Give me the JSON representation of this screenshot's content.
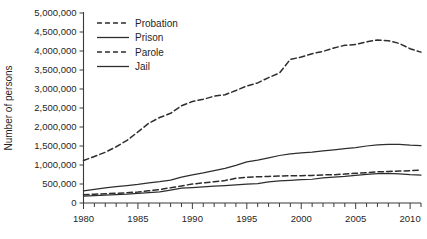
{
  "chart_data": {
    "type": "line",
    "title": "",
    "xlabel": "",
    "ylabel": "Number of persons",
    "xlim": [
      1980,
      2011
    ],
    "ylim": [
      0,
      5000000
    ],
    "grid": false,
    "legend_position": "top-left",
    "xticklabels": [
      "1980",
      "1985",
      "1990",
      "1995",
      "2000",
      "2005",
      "2010"
    ],
    "xtickvalues": [
      1980,
      1985,
      1990,
      1995,
      2000,
      2005,
      2010
    ],
    "xminortick_step": 1,
    "yticklabels": [
      "0",
      "500,000",
      "1,000,000",
      "1,500,000",
      "2,000,000",
      "2,500,000",
      "3,000,000",
      "3,500,000",
      "4,000,000",
      "4,500,000",
      "5,000,000"
    ],
    "ytickvalues": [
      0,
      500000,
      1000000,
      1500000,
      2000000,
      2500000,
      3000000,
      3500000,
      4000000,
      4500000,
      5000000
    ],
    "x": [
      1980,
      1981,
      1982,
      1983,
      1984,
      1985,
      1986,
      1987,
      1988,
      1989,
      1990,
      1991,
      1992,
      1993,
      1994,
      1995,
      1996,
      1997,
      1998,
      1999,
      2000,
      2001,
      2002,
      2003,
      2004,
      2005,
      2006,
      2007,
      2008,
      2009,
      2010,
      2011
    ],
    "series": [
      {
        "name": "Probation",
        "style": "dashed",
        "color": "#2e2e2e",
        "values": [
          1118000,
          1225000,
          1335000,
          1480000,
          1650000,
          1870000,
          2100000,
          2250000,
          2360000,
          2560000,
          2670000,
          2730000,
          2810000,
          2850000,
          2960000,
          3080000,
          3160000,
          3300000,
          3420000,
          3780000,
          3840000,
          3930000,
          3990000,
          4080000,
          4150000,
          4170000,
          4240000,
          4290000,
          4270000,
          4200000,
          4060000,
          3970000
        ]
      },
      {
        "name": "Prison",
        "style": "solid",
        "color": "#2e2e2e",
        "values": [
          320000,
          360000,
          400000,
          430000,
          460000,
          490000,
          530000,
          560000,
          600000,
          680000,
          740000,
          790000,
          850000,
          910000,
          990000,
          1080000,
          1130000,
          1190000,
          1250000,
          1290000,
          1320000,
          1340000,
          1370000,
          1400000,
          1430000,
          1460000,
          1500000,
          1530000,
          1540000,
          1540000,
          1520000,
          1510000
        ]
      },
      {
        "name": "Parole",
        "style": "dashed",
        "color": "#2e2e2e",
        "values": [
          220000,
          230000,
          245000,
          255000,
          270000,
          290000,
          320000,
          355000,
          400000,
          450000,
          500000,
          530000,
          560000,
          590000,
          650000,
          680000,
          690000,
          700000,
          710000,
          715000,
          720000,
          725000,
          740000,
          745000,
          760000,
          780000,
          800000,
          820000,
          830000,
          840000,
          850000,
          870000
        ]
      },
      {
        "name": "Jail",
        "style": "solid",
        "color": "#2e2e2e",
        "values": [
          182000,
          195000,
          207000,
          220000,
          232000,
          254000,
          272000,
          292000,
          340000,
          390000,
          405000,
          424000,
          442000,
          459000,
          479000,
          499000,
          510000,
          557000,
          584000,
          596000,
          612000,
          625000,
          660000,
          680000,
          700000,
          730000,
          755000,
          775000,
          780000,
          765000,
          745000,
          735000
        ]
      }
    ],
    "legend": [
      {
        "label": "Probation",
        "style": "dashed"
      },
      {
        "label": "Prison",
        "style": "solid"
      },
      {
        "label": "Parole",
        "style": "dashed"
      },
      {
        "label": "Jail",
        "style": "solid"
      }
    ]
  }
}
